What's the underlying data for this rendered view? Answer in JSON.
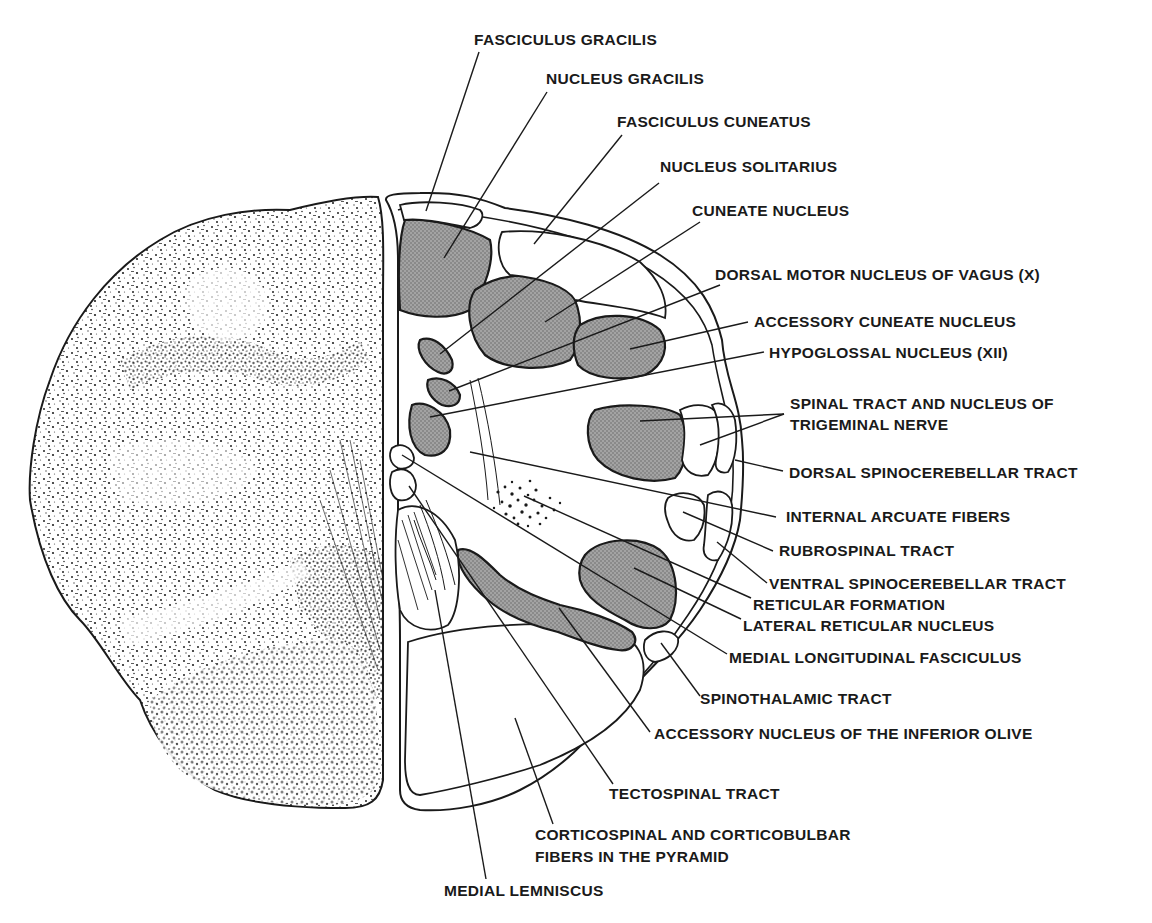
{
  "figure": {
    "left_half": "stained histological section",
    "right_half": "labeled schematic"
  },
  "labels": [
    {
      "id": "fasciculus_gracilis",
      "text": "FASCICULUS GRACILIS"
    },
    {
      "id": "nucleus_gracilis",
      "text": "NUCLEUS GRACILIS"
    },
    {
      "id": "fasciculus_cuneatus",
      "text": "FASCICULUS CUNEATUS"
    },
    {
      "id": "nucleus_solitarius",
      "text": "NUCLEUS SOLITARIUS"
    },
    {
      "id": "cuneate_nucleus",
      "text": "CUNEATE NUCLEUS"
    },
    {
      "id": "dorsal_motor_vagus",
      "text": "DORSAL MOTOR NUCLEUS OF VAGUS (X)"
    },
    {
      "id": "accessory_cuneate",
      "text": "ACCESSORY CUNEATE NUCLEUS"
    },
    {
      "id": "hypoglossal",
      "text": "HYPOGLOSSAL NUCLEUS (XII)"
    },
    {
      "id": "spinal_trigeminal_1",
      "text": "SPINAL TRACT AND NUCLEUS OF"
    },
    {
      "id": "spinal_trigeminal_2",
      "text": "TRIGEMINAL NERVE"
    },
    {
      "id": "dorsal_spinocerebellar",
      "text": "DORSAL SPINOCEREBELLAR TRACT"
    },
    {
      "id": "internal_arcuate",
      "text": "INTERNAL ARCUATE FIBERS"
    },
    {
      "id": "rubrospinal",
      "text": "RUBROSPINAL TRACT"
    },
    {
      "id": "ventral_spinocerebellar",
      "text": "VENTRAL SPINOCEREBELLAR  TRACT"
    },
    {
      "id": "reticular_formation",
      "text": "RETICULAR FORMATION"
    },
    {
      "id": "lateral_reticular",
      "text": "LATERAL RETICULAR NUCLEUS"
    },
    {
      "id": "mlf",
      "text": "MEDIAL LONGITUDINAL FASCICULUS"
    },
    {
      "id": "spinothalamic",
      "text": "SPINOTHALAMIC TRACT"
    },
    {
      "id": "accessory_olive",
      "text": "ACCESSORY NUCLEUS OF THE INFERIOR OLIVE"
    },
    {
      "id": "tectospinal",
      "text": "TECTOSPINAL TRACT"
    },
    {
      "id": "corticospinal_1",
      "text": "CORTICOSPINAL AND CORTICOBULBAR"
    },
    {
      "id": "corticospinal_2",
      "text": "FIBERS IN THE PYRAMID"
    },
    {
      "id": "medial_lemniscus",
      "text": "MEDIAL LEMNISCUS"
    }
  ],
  "colors": {
    "ink": "#1a1a1a",
    "nucleus_fill": "#9a9a9a",
    "background": "#ffffff"
  }
}
